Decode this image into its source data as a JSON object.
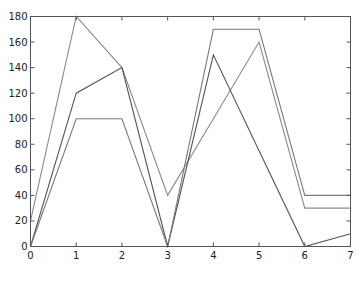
{
  "chart_data": {
    "type": "line",
    "title": "",
    "xlabel": "",
    "ylabel": "",
    "x": [
      0,
      1,
      2,
      3,
      4,
      5,
      6,
      7
    ],
    "xlim": [
      0,
      7
    ],
    "ylim": [
      0,
      180
    ],
    "xticks": [
      0,
      1,
      2,
      3,
      4,
      5,
      6,
      7
    ],
    "yticks": [
      0,
      20,
      40,
      60,
      80,
      100,
      120,
      140,
      160,
      180
    ],
    "grid": false,
    "legend": null,
    "series": [
      {
        "name": "series-1",
        "color": "#8a8a8a",
        "values": [
          20,
          180,
          140,
          40,
          100,
          160,
          30,
          30
        ]
      },
      {
        "name": "series-2",
        "color": "#555555",
        "values": [
          0,
          120,
          140,
          0,
          150,
          75,
          0,
          10
        ]
      },
      {
        "name": "series-3",
        "color": "#7a7a7a",
        "values": [
          0,
          100,
          100,
          0,
          170,
          170,
          40,
          40
        ]
      }
    ]
  }
}
